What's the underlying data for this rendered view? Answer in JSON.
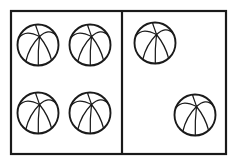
{
  "figure": {
    "title": "Two groups of balls separated by a vertical divider",
    "background_color": "#ffffff",
    "line_color": "#1a1a1a",
    "fill_color": "#ffffff",
    "width": 237,
    "height": 165,
    "total_ball_count": 6
  },
  "frame": {
    "x": 11,
    "y": 11,
    "width": 215,
    "height": 143,
    "stroke_width": 2.2,
    "stroke_color": "#1a1a1a"
  },
  "divider": {
    "orientation": "vertical",
    "x": 122,
    "y_top": 11,
    "y_bottom": 154,
    "stroke_width": 2.2,
    "stroke_color": "#1a1a1a"
  },
  "panels": [
    {
      "id": "left-panel",
      "label": "Left group",
      "ball_count": 4,
      "arrangement": "2 by 2 grid",
      "balls": [
        {
          "id": "ball-left-1",
          "icon": "ball-icon",
          "cx": 38,
          "cy": 45,
          "r": 20.5
        },
        {
          "id": "ball-left-2",
          "icon": "ball-icon",
          "cx": 90,
          "cy": 45,
          "r": 20.5
        },
        {
          "id": "ball-left-3",
          "icon": "ball-icon",
          "cx": 38,
          "cy": 113,
          "r": 20.5
        },
        {
          "id": "ball-left-4",
          "icon": "ball-icon",
          "cx": 90,
          "cy": 113,
          "r": 20.5
        }
      ]
    },
    {
      "id": "right-panel",
      "label": "Right group",
      "ball_count": 2,
      "arrangement": "diagonal, upper left and lower right",
      "balls": [
        {
          "id": "ball-right-1",
          "icon": "ball-icon",
          "cx": 155,
          "cy": 43,
          "r": 20.5
        },
        {
          "id": "ball-right-2",
          "icon": "ball-icon",
          "cx": 195,
          "cy": 115,
          "r": 20.5
        }
      ]
    }
  ],
  "ball_icon": {
    "name": "ball-icon",
    "description": "circle outline with curved seams radiating from an upper-center node",
    "outline_stroke_width": 1.9,
    "seam_stroke_width": 1.25,
    "seam_count": 6
  }
}
